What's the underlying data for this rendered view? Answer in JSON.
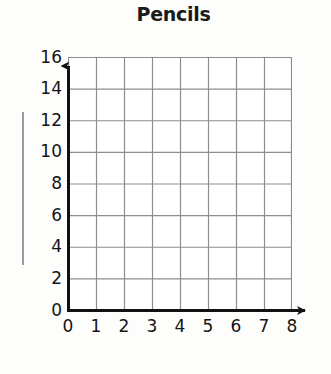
{
  "chart_data": {
    "type": "grid",
    "title": "Pencils",
    "subtitle": "",
    "xlabel": "",
    "ylabel": "",
    "xlim": [
      0,
      8
    ],
    "ylim": [
      0,
      16
    ],
    "x_ticks": [
      "0",
      "1",
      "2",
      "3",
      "4",
      "5",
      "6",
      "7",
      "8"
    ],
    "y_ticks": [
      "0",
      "2",
      "4",
      "6",
      "8",
      "10",
      "12",
      "14",
      "16"
    ],
    "x_tick_values": [
      0,
      1,
      2,
      3,
      4,
      5,
      6,
      7,
      8
    ],
    "y_tick_values": [
      0,
      2,
      4,
      6,
      8,
      10,
      12,
      14,
      16
    ],
    "x_major_step": 1,
    "y_major_step": 2,
    "grid": true,
    "grid_columns": 8,
    "grid_rows": 8,
    "legend": null,
    "series": [],
    "values": [],
    "categories": [],
    "annotations": [],
    "note": "Empty coordinate grid with no plotted data; axes drawn with arrowheads pointing up and right."
  },
  "colors": {
    "background": "#fdfdfc",
    "plot_background": "#ffffff",
    "gridline": "#8d8d8d",
    "axis": "#111111",
    "text": "#141414",
    "title": "#1a1a1a",
    "rule": "#9a9a9a"
  },
  "axes": {
    "y_axis_name": "y-axis",
    "x_axis_name": "x-axis",
    "y_arrow": "arrow-up",
    "x_arrow": "arrow-right"
  },
  "decor": {
    "left_rule_label": "vertical-rule"
  }
}
